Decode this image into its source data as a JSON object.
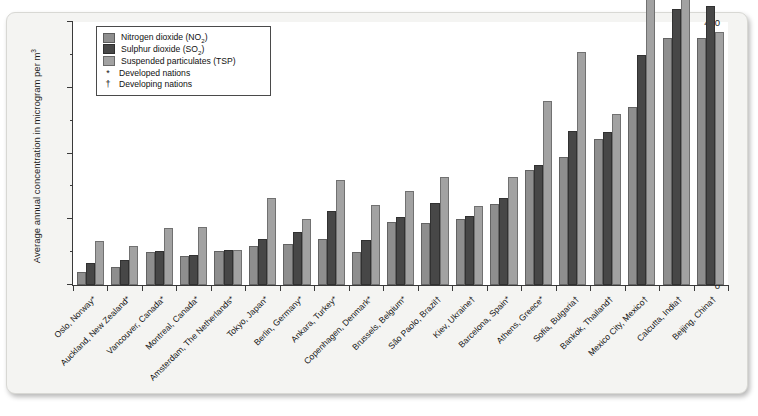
{
  "figure": {
    "top_strip_text": "",
    "y_axis_title": "Average annual concentration in microgram per m",
    "y_axis_title_exponent": "3"
  },
  "legend": {
    "items": [
      {
        "label": "Nitrogen dioxide (NO",
        "sub": "2",
        "tail": ")",
        "type": "swatch",
        "key": "no2",
        "color": "#8e8e8e",
        "name": "legend-no2"
      },
      {
        "label": "Sulphur dioxide (SO",
        "sub": "2",
        "tail": ")",
        "type": "swatch",
        "key": "so2",
        "color": "#474747",
        "name": "legend-so2"
      },
      {
        "label": "Suspended particulates (TSP)",
        "sub": "",
        "tail": "",
        "type": "swatch",
        "key": "tsp",
        "color": "#a2a2a2",
        "name": "legend-tsp"
      },
      {
        "label": "Developed nations",
        "sub": "",
        "tail": "",
        "type": "symbol",
        "symbol": "*",
        "name": "legend-developed"
      },
      {
        "label": "Developing nations",
        "sub": "",
        "tail": "",
        "type": "symbol",
        "symbol": "†",
        "name": "legend-developing"
      }
    ]
  },
  "chart_data": {
    "type": "bar",
    "title": "",
    "xlabel": "",
    "ylabel": "Average annual concentration in microgram per m3",
    "ylim": [
      0,
      400
    ],
    "yticks": [
      0,
      100,
      200,
      300,
      400
    ],
    "yticks_minor": [
      50,
      150,
      250,
      350
    ],
    "grid": false,
    "legend_position": "top-left-inside",
    "categories": [
      "Oslo, Norway*",
      "Auckland, New Zealand*",
      "Vancouver, Canada*",
      "Montreal, Canada*",
      "Amsterdam, The Netherlands*",
      "Tokyo, Japan*",
      "Berlin, Germany*",
      "Ankara, Turkey*",
      "Copenhagen, Denmark*",
      "Brussels, Belgium*",
      "São Paolo, Brazil†",
      "Kiev, Ukraine†",
      "Barcelona, Spain*",
      "Athens, Greece*",
      "Sofia, Bulgaria†",
      "Bankok, Thailand†",
      "Mexico City, Mexico†",
      "Calcutta, India†",
      "Beijing, China†"
    ],
    "series": [
      {
        "name": "Nitrogen dioxide (NO2)",
        "key": "no2",
        "color": "#8e8e8e",
        "values": [
          20,
          28,
          50,
          44,
          52,
          60,
          62,
          70,
          50,
          96,
          95,
          100,
          123,
          175,
          195,
          222,
          270,
          375,
          375
        ]
      },
      {
        "name": "Sulphur dioxide (SO2)",
        "key": "so2",
        "color": "#474747",
        "values": [
          33,
          38,
          52,
          45,
          53,
          70,
          80,
          112,
          68,
          104,
          125,
          105,
          132,
          182,
          235,
          232,
          350,
          420,
          425
        ]
      },
      {
        "name": "Suspended particulates (TSP)",
        "key": "tsp",
        "color": "#a2a2a2",
        "values": [
          67,
          60,
          86,
          88,
          53,
          133,
          100,
          160,
          122,
          143,
          165,
          120,
          165,
          280,
          355,
          260,
          480,
          455,
          385
        ]
      }
    ]
  }
}
